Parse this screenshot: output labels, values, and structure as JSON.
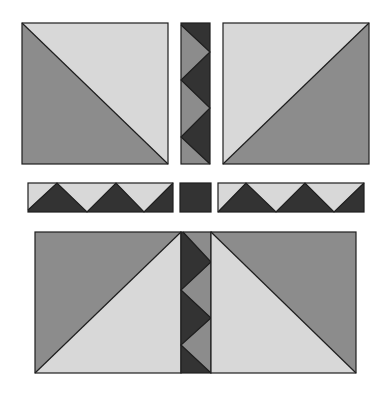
{
  "colors": {
    "background": "#ffffff",
    "light": "#d8d8d8",
    "medium": "#8c8c8c",
    "dark": "#333333",
    "outline": "#1e1e1e"
  },
  "blocks": {
    "top_left": {
      "label": "half-square triangle block (light top-right, medium bottom-left)"
    },
    "top_right": {
      "label": "half-square triangle block (light top-left, medium bottom-right)"
    },
    "bottom_left": {
      "label": "half-square triangle block (medium top-left, light bottom-right)"
    },
    "bottom_right": {
      "label": "half-square triangle block (light bottom-left, medium top-right)"
    }
  },
  "sashing": {
    "top_vertical": {
      "label": "vertical sawtooth strip (medium on dark)"
    },
    "bottom_vertical": {
      "label": "vertical sawtooth strip (dark on medium)"
    },
    "left_horizontal": {
      "label": "horizontal sawtooth strip (dark on light)"
    },
    "right_horizontal": {
      "label": "horizontal sawtooth strip (dark on light)"
    },
    "center_square": {
      "label": "dark cornerstone square"
    }
  }
}
